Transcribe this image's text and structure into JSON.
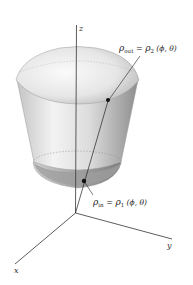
{
  "diagram": {
    "type": "3d-solid-spherical-coordinates",
    "axes": {
      "z_label": "z",
      "x_label": "x",
      "y_label": "y"
    },
    "annotations": {
      "outer": {
        "rho": "ρ",
        "sub_left": "out",
        "eq": " = ",
        "rho2": "ρ",
        "sub_right": "2",
        "args": " (ϕ, θ)"
      },
      "inner": {
        "rho": "ρ",
        "sub_left": "in",
        "eq": " = ",
        "rho2": "ρ",
        "sub_right": "1",
        "args": " (ϕ, θ)"
      }
    },
    "colors": {
      "background": "#ffffff",
      "axis": "#333333",
      "surface_light": "#f2f2f2",
      "surface_mid": "#cfcfcf",
      "surface_dark": "#8e8e8e"
    }
  }
}
